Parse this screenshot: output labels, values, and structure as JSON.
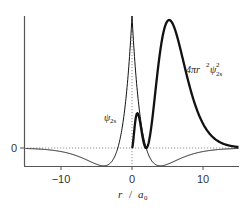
{
  "chart_data": {
    "type": "line",
    "title": "",
    "xlabel": "r / a0",
    "ylabel": "",
    "xlim": [
      -15,
      15
    ],
    "x_ticks": [
      -10,
      0,
      10
    ],
    "x_tick_labels": [
      "−10",
      "0",
      "10"
    ],
    "y_ticks": [
      0
    ],
    "y_tick_labels": [
      "0"
    ],
    "grid": false,
    "reference_lines": [
      {
        "orientation": "horizontal",
        "value": 0,
        "style": "dotted"
      },
      {
        "orientation": "vertical",
        "value": 0,
        "style": "dotted"
      }
    ],
    "series": [
      {
        "name": "psi_2s",
        "label": "ψ2s",
        "style": "thin",
        "formula": "(2 - |r|) * exp(-|r|/2)",
        "x": [
          -15,
          -12,
          -10,
          -8,
          -6,
          -4,
          -3,
          -2,
          -1,
          0,
          1,
          2,
          3,
          4,
          6,
          8,
          10,
          12,
          15
        ],
        "values": [
          -0.0072,
          -0.0248,
          -0.0539,
          -0.1099,
          -0.1992,
          -0.2707,
          -0.2231,
          0,
          0.6065,
          2.0,
          0.6065,
          0,
          -0.2231,
          -0.2707,
          -0.1992,
          -0.1099,
          -0.0539,
          -0.0248,
          -0.0072
        ]
      },
      {
        "name": "radial_distribution_2s",
        "label": "4πr²ψ²2s",
        "style": "thick",
        "formula": "r^2 (2 - r)^2 exp(-r)",
        "x": [
          0,
          0.5,
          0.76,
          1,
          1.5,
          2,
          3,
          4,
          5,
          5.24,
          6,
          7,
          8,
          10,
          12,
          15
        ],
        "values": [
          0,
          0.1365,
          0.416,
          0.3679,
          0.1255,
          0,
          0.448,
          1.1722,
          1.516,
          1.528,
          1.4277,
          1.1401,
          0.7716,
          0.2908,
          0.0883,
          0.0086
        ]
      }
    ],
    "annotations": [
      {
        "text": "ψ2s",
        "near_x": -1.5
      },
      {
        "text": "4πr²ψ²2s",
        "near_x": 9
      }
    ]
  },
  "labels": {
    "y_zero": "0",
    "x_ticks": [
      "−10",
      "0",
      "10"
    ],
    "x_axis_r": "r",
    "x_axis_slash": "/",
    "x_axis_a": "a",
    "x_axis_a_sub": "0",
    "psi_label": "ψ",
    "psi_sub": "2s",
    "rdf_prefix": "4πr",
    "rdf_sup_r": "2",
    "rdf_psi": "ψ",
    "rdf_sup": "2",
    "rdf_sub": "2s"
  },
  "colors": {
    "axis": "#555555",
    "curve": "#111111",
    "dotted": "#666666",
    "text": "#333333"
  }
}
